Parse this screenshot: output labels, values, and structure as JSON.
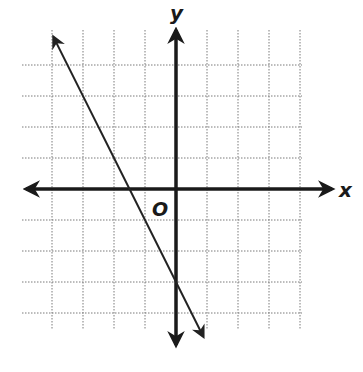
{
  "chart_data": {
    "type": "line",
    "title": "",
    "xlabel": "x",
    "ylabel": "y",
    "origin_label": "O",
    "xlim": [
      -4.5,
      4.5
    ],
    "ylim": [
      -4.5,
      4.5
    ],
    "grid": true,
    "grid_style": "dotted",
    "grid_spacing": 1,
    "tick_labels": false,
    "series": [
      {
        "name": "line",
        "equation": "y = -2x - 3",
        "slope": -2,
        "y_intercept": -3,
        "x_intercept": -1.5,
        "x": [
          -4,
          -3,
          -2,
          -1.5,
          -1,
          0,
          0.5
        ],
        "y": [
          5,
          3,
          1,
          0,
          -1,
          -3,
          -4
        ],
        "arrows": "both"
      }
    ],
    "axes_arrows": true
  },
  "layout": {
    "origin_px": [
      176,
      189
    ],
    "unit_px": 31,
    "grid_x_range_px": [
      24,
      302
    ],
    "grid_y_range_px": [
      30,
      330
    ]
  },
  "colors": {
    "axis": "#1a1a1a",
    "grid": "#7a7a7a",
    "line": "#222222",
    "background": "#ffffff"
  }
}
